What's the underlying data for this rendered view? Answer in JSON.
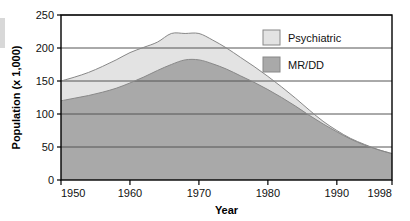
{
  "chart_data": {
    "type": "area",
    "stacked": true,
    "title": "",
    "xlabel": "Year",
    "ylabel": "Population (x 1,000)",
    "xlim": [
      1950,
      1998
    ],
    "ylim": [
      0,
      250
    ],
    "grid": true,
    "legend_position": "top-right",
    "xticks": [
      1950,
      1960,
      1970,
      1980,
      1990,
      1998
    ],
    "xtick_labels": [
      "1950",
      "1960",
      "1970",
      "1980",
      "1990",
      "1998"
    ],
    "yticks": [
      0,
      50,
      100,
      150,
      200,
      250
    ],
    "ytick_labels": [
      "0",
      "50",
      "100",
      "150",
      "200",
      "250"
    ],
    "x": [
      1950,
      1952,
      1954,
      1956,
      1958,
      1960,
      1962,
      1964,
      1966,
      1968,
      1970,
      1972,
      1974,
      1976,
      1978,
      1980,
      1982,
      1984,
      1986,
      1988,
      1990,
      1992,
      1994,
      1996,
      1998
    ],
    "series": [
      {
        "name": "MR/DD",
        "color": "#a9a9a9",
        "values": [
          120,
          124,
          128,
          133,
          139,
          147,
          156,
          166,
          175,
          182,
          182,
          176,
          168,
          158,
          148,
          137,
          125,
          112,
          98,
          85,
          73,
          62,
          53,
          46,
          40
        ]
      },
      {
        "name": "Psychiatric",
        "color": "#e3e3e3",
        "values": [
          30,
          32,
          35,
          39,
          43,
          46,
          45,
          43,
          47,
          40,
          40,
          36,
          32,
          28,
          24,
          20,
          16,
          12,
          8,
          4,
          2,
          1,
          1,
          0,
          0
        ]
      }
    ],
    "totals": [
      150,
      156,
      163,
      172,
      182,
      193,
      201,
      209,
      222,
      222,
      222,
      212,
      200,
      186,
      172,
      157,
      141,
      124,
      106,
      89,
      75,
      63,
      54,
      46,
      40
    ],
    "annotations": {
      "mrdd_peak_value": 182,
      "mrdd_peak_years": "1968-1970",
      "total_peak_value": 222,
      "total_peak_years": "1966-1970",
      "mrdd_start_value": 120,
      "total_start_value": 150,
      "end_value": 40
    }
  },
  "legend": {
    "items": [
      {
        "label": "Psychiatric",
        "swatch_color": "#e3e3e3"
      },
      {
        "label": "MR/DD",
        "swatch_color": "#a9a9a9"
      }
    ]
  },
  "colors": {
    "axis": "#000000",
    "gridline": "#555555",
    "series_light": "#e3e3e3",
    "series_dark": "#a9a9a9",
    "stroke": "#888888",
    "background": "#ffffff"
  }
}
